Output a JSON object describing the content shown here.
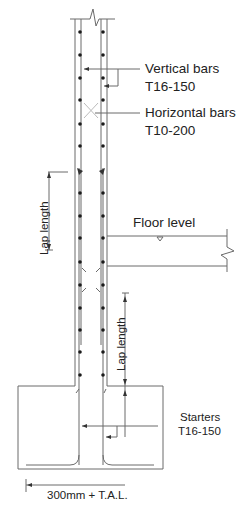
{
  "diagram": {
    "type": "reinforced concrete wall/column section with footing",
    "colors": {
      "line": "#6a6a6a",
      "bar": "#222222",
      "text": "#222222",
      "background": "#ffffff"
    },
    "labels": {
      "vertical_bars": "Vertical bars",
      "vertical_bars_spec": "T16-150",
      "horizontal_bars": "Horizontal bars",
      "horizontal_bars_spec": "T10-200",
      "floor_level": "Floor level",
      "lap_length_upper": "Lap length",
      "lap_length_lower": "Lap length",
      "starters": "Starters",
      "starters_spec": "T16-150",
      "dimension_bottom": "300mm + T.A.L."
    }
  }
}
